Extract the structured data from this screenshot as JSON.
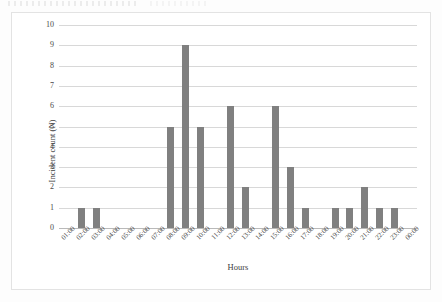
{
  "chart_data": {
    "type": "bar",
    "title": "",
    "xlabel": "Hours",
    "ylabel": "Incident count (N)",
    "ylim": [
      0,
      10
    ],
    "yticks": [
      10,
      9,
      8,
      7,
      6,
      5,
      4,
      3,
      2,
      1,
      0
    ],
    "grid": true,
    "legend": "none",
    "bar_color": "#808080",
    "categories": [
      "01:00",
      "02:00",
      "03:00",
      "04:00",
      "05:00",
      "06:00",
      "07:00",
      "08:00",
      "09:00",
      "10:00",
      "11:00",
      "12:00",
      "13:00",
      "14:00",
      "15:00",
      "16:00",
      "17:00",
      "18:00",
      "19:00",
      "20:00",
      "21:00",
      "22:00",
      "23:00",
      "00:00"
    ],
    "values": [
      0,
      1,
      1,
      0,
      0,
      0,
      0,
      5,
      9,
      5,
      0,
      6,
      2,
      0,
      6,
      3,
      1,
      0,
      1,
      1,
      2,
      1,
      1,
      0
    ]
  }
}
